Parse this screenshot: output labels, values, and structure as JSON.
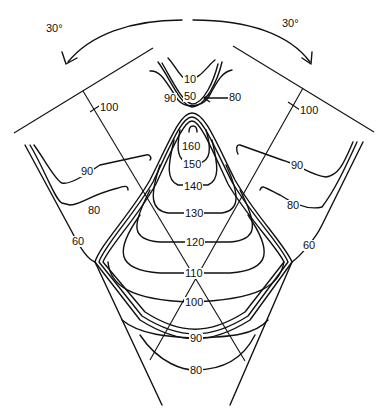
{
  "diagram": {
    "type": "isodose contour diagram (two angled fields, rotation arrows)",
    "rotation_arrows": [
      {
        "side": "left",
        "label": "30°"
      },
      {
        "side": "right",
        "label": "30°"
      }
    ],
    "central_axis_marks": [
      {
        "side": "left",
        "label": "100"
      },
      {
        "side": "right",
        "label": "100"
      }
    ],
    "top_region_labels": {
      "inner": "10",
      "middle": "50",
      "left": "90",
      "arrow_label": "80"
    },
    "central_contours": [
      "160",
      "150",
      "140",
      "130",
      "120",
      "110",
      "100",
      "90",
      "80"
    ],
    "left_lobe_labels": [
      "90",
      "80",
      "60"
    ],
    "right_lobe_labels": [
      "90",
      "80",
      "60"
    ]
  },
  "colors": {
    "line": "#111111",
    "background": "#ffffff"
  }
}
